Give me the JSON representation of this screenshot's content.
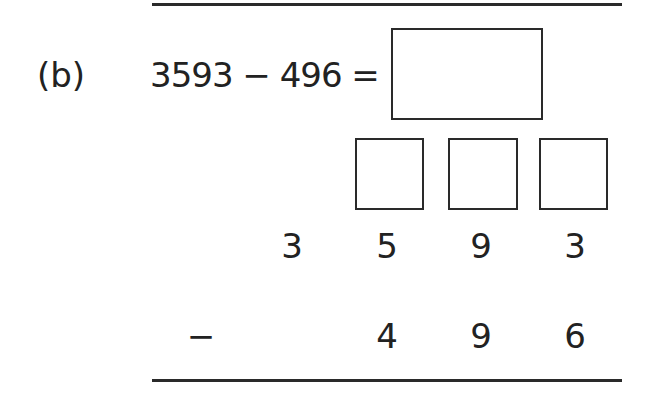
{
  "question": {
    "label": "(b)",
    "equation": "3593 − 496 =",
    "answer_value": ""
  },
  "column_method": {
    "exchange_boxes": [
      "",
      "",
      ""
    ],
    "minuend_digits": [
      "3",
      "5",
      "9",
      "3"
    ],
    "operator": "−",
    "subtrahend_digits": [
      "4",
      "9",
      "6"
    ]
  }
}
